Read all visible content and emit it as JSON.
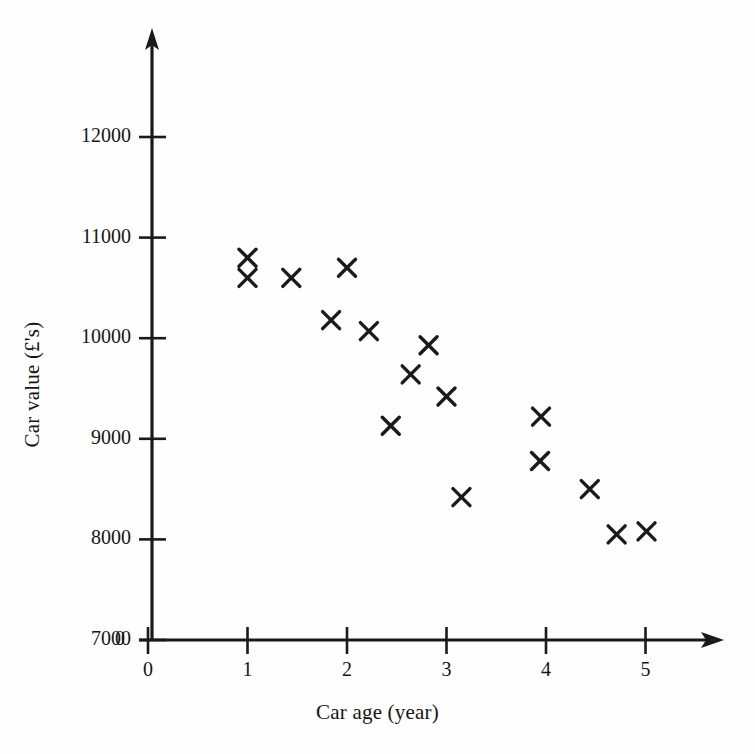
{
  "chart_data": {
    "type": "scatter",
    "title": "",
    "xlabel": "Car age (year)",
    "ylabel": "Car value (£'s)",
    "xlim": [
      0,
      5.75
    ],
    "ylim": [
      7000,
      12500
    ],
    "xticks": [
      0,
      1,
      2,
      3,
      4,
      5
    ],
    "xtick_labels": [
      "0",
      "1",
      "2",
      "3",
      "4",
      "5"
    ],
    "yticks": [
      7000,
      8000,
      9000,
      10000,
      11000,
      12000
    ],
    "ytick_labels": [
      "7000",
      "8000",
      "9000",
      "10000",
      "11000",
      "12000"
    ],
    "origin_label": "0",
    "grid": false,
    "legend": "none",
    "marker": "x-cross",
    "marker_color": "#1a1a1a",
    "axis_color": "#1a1a1a",
    "points": [
      {
        "x": 1.0,
        "y": 10800
      },
      {
        "x": 1.0,
        "y": 10600
      },
      {
        "x": 1.44,
        "y": 10600
      },
      {
        "x": 2.0,
        "y": 10700
      },
      {
        "x": 1.84,
        "y": 10180
      },
      {
        "x": 2.22,
        "y": 10070
      },
      {
        "x": 2.82,
        "y": 9930
      },
      {
        "x": 2.64,
        "y": 9640
      },
      {
        "x": 3.0,
        "y": 9420
      },
      {
        "x": 2.44,
        "y": 9130
      },
      {
        "x": 3.95,
        "y": 9220
      },
      {
        "x": 3.94,
        "y": 8780
      },
      {
        "x": 3.15,
        "y": 8420
      },
      {
        "x": 4.44,
        "y": 8500
      },
      {
        "x": 4.71,
        "y": 8050
      },
      {
        "x": 5.01,
        "y": 8080
      }
    ]
  }
}
